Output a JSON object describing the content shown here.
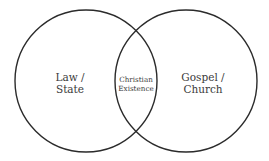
{
  "diagram": {
    "type": "venn",
    "circles": [
      {
        "id": "left",
        "label_line1": "Law /",
        "label_line2": "State"
      },
      {
        "id": "right",
        "label_line1": "Gospel /",
        "label_line2": "Church"
      }
    ],
    "intersection": {
      "label_line1": "Christian",
      "label_line2": "Existence"
    },
    "colors": {
      "stroke": "#2b2b2b",
      "text": "#3a3a3a",
      "background": "#ffffff"
    }
  }
}
